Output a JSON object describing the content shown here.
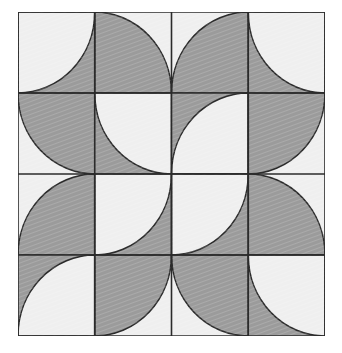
{
  "figure": {
    "type": "geometric-tile-pattern",
    "rows": 4,
    "cols": 4,
    "origin_x": 18,
    "origin_y": 12,
    "width": 307,
    "height": 324,
    "cell_width": 76.75,
    "cell_height": 81
  },
  "colors": {
    "dark": "#9b9b9b",
    "light": "#efefef",
    "stroke": "#2b2b2b",
    "page_background": "#ffffff",
    "texture_line": "#ffffff"
  },
  "style": {
    "stroke_width": 1.6,
    "texture": "fine diagonal hatch",
    "texture_angle_deg": 70
  },
  "tiles": [
    {
      "row": 0,
      "col": 0,
      "background": "dark",
      "arc_corner": "top-left",
      "arc_fill": "light"
    },
    {
      "row": 0,
      "col": 1,
      "background": "light",
      "arc_corner": "bottom-left",
      "arc_fill": "dark"
    },
    {
      "row": 0,
      "col": 2,
      "background": "light",
      "arc_corner": "bottom-right",
      "arc_fill": "dark"
    },
    {
      "row": 0,
      "col": 3,
      "background": "dark",
      "arc_corner": "top-right",
      "arc_fill": "light"
    },
    {
      "row": 1,
      "col": 0,
      "background": "light",
      "arc_corner": "top-right",
      "arc_fill": "dark"
    },
    {
      "row": 1,
      "col": 1,
      "background": "dark",
      "arc_corner": "top-right",
      "arc_fill": "light"
    },
    {
      "row": 1,
      "col": 2,
      "background": "dark",
      "arc_corner": "bottom-right",
      "arc_fill": "light"
    },
    {
      "row": 1,
      "col": 3,
      "background": "light",
      "arc_corner": "top-left",
      "arc_fill": "dark"
    },
    {
      "row": 2,
      "col": 0,
      "background": "light",
      "arc_corner": "bottom-right",
      "arc_fill": "dark"
    },
    {
      "row": 2,
      "col": 1,
      "background": "dark",
      "arc_corner": "top-left",
      "arc_fill": "light"
    },
    {
      "row": 2,
      "col": 2,
      "background": "dark",
      "arc_corner": "top-left",
      "arc_fill": "light"
    },
    {
      "row": 2,
      "col": 3,
      "background": "light",
      "arc_corner": "bottom-left",
      "arc_fill": "dark"
    },
    {
      "row": 3,
      "col": 0,
      "background": "dark",
      "arc_corner": "bottom-right",
      "arc_fill": "light"
    },
    {
      "row": 3,
      "col": 1,
      "background": "light",
      "arc_corner": "top-left",
      "arc_fill": "dark"
    },
    {
      "row": 3,
      "col": 2,
      "background": "light",
      "arc_corner": "top-right",
      "arc_fill": "dark"
    },
    {
      "row": 3,
      "col": 3,
      "background": "dark",
      "arc_corner": "top-right",
      "arc_fill": "light"
    }
  ]
}
